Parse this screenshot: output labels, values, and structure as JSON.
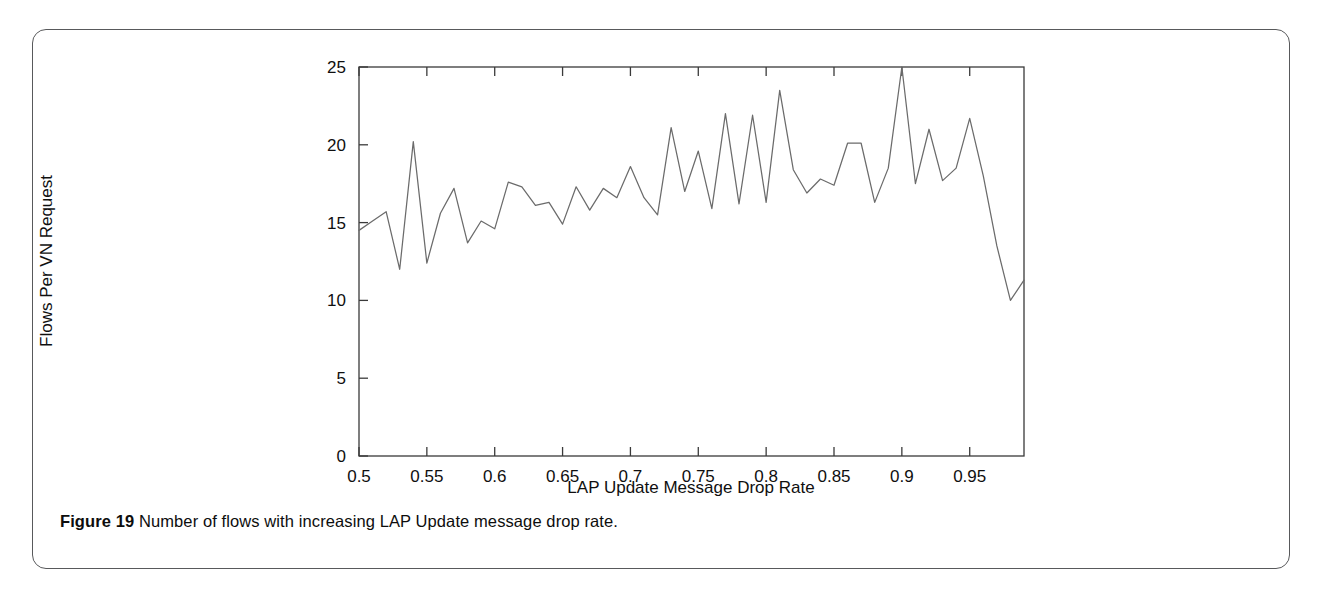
{
  "figure": {
    "caption_label": "Figure 19",
    "caption_text": "Number of flows with increasing LAP Update message drop rate."
  },
  "colors": {
    "card_border": "#58595b",
    "axis": "#3a3a3a",
    "line": "#6b6b6b",
    "text": "#0f0f0f",
    "background": "#ffffff"
  },
  "chart_data": {
    "type": "line",
    "title": "",
    "xlabel": "LAP Update Message Drop Rate",
    "ylabel": "Flows Per VN Request",
    "xlim": [
      0.5,
      0.99
    ],
    "ylim": [
      0,
      25
    ],
    "xticks": [
      0.5,
      0.55,
      0.6,
      0.65,
      0.7,
      0.75,
      0.8,
      0.85,
      0.9,
      0.95
    ],
    "xtick_labels": [
      "0.5",
      "0.55",
      "0.6",
      "0.65",
      "0.7",
      "0.75",
      "0.8",
      "0.85",
      "0.9",
      "0.95"
    ],
    "yticks": [
      0,
      5,
      10,
      15,
      20,
      25
    ],
    "ytick_labels": [
      "0",
      "5",
      "10",
      "15",
      "20",
      "25"
    ],
    "grid": false,
    "legend": false,
    "series": [
      {
        "name": "Flows Per VN Request",
        "x": [
          0.5,
          0.51,
          0.52,
          0.53,
          0.54,
          0.55,
          0.56,
          0.57,
          0.58,
          0.59,
          0.6,
          0.61,
          0.62,
          0.63,
          0.64,
          0.65,
          0.66,
          0.67,
          0.68,
          0.69,
          0.7,
          0.71,
          0.72,
          0.73,
          0.74,
          0.75,
          0.76,
          0.77,
          0.78,
          0.79,
          0.8,
          0.81,
          0.82,
          0.83,
          0.84,
          0.85,
          0.86,
          0.87,
          0.88,
          0.89,
          0.9,
          0.91,
          0.92,
          0.93,
          0.94,
          0.95,
          0.96,
          0.97,
          0.98,
          0.99
        ],
        "values": [
          14.5,
          15.1,
          15.7,
          12.0,
          20.2,
          12.4,
          15.6,
          17.2,
          13.7,
          15.1,
          14.6,
          17.6,
          17.3,
          16.1,
          16.3,
          14.9,
          17.3,
          15.8,
          17.2,
          16.6,
          18.6,
          16.6,
          15.5,
          21.1,
          17.0,
          19.6,
          15.9,
          22.0,
          16.2,
          21.9,
          16.3,
          23.5,
          18.4,
          16.9,
          17.8,
          17.4,
          20.1,
          20.1,
          16.3,
          18.5,
          25.0,
          17.5,
          21.0,
          17.7,
          18.5,
          21.7,
          18.0,
          13.5,
          10.0,
          11.3
        ]
      }
    ]
  }
}
